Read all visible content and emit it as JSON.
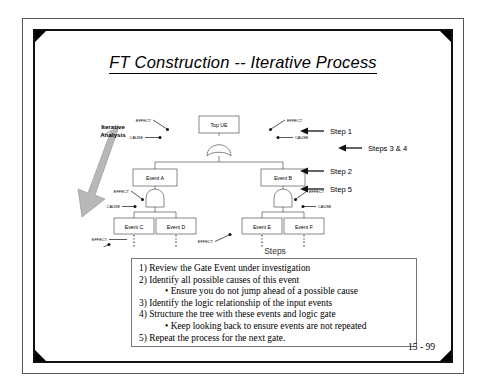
{
  "slide": {
    "title": "FT Construction -- Iterative Process",
    "page_number": "15 - 99"
  },
  "diagram": {
    "iterative_label_line1": "Iterative",
    "iterative_label_line2": "Analysis",
    "nodes": {
      "top": "Top UE",
      "a": "Event A",
      "b": "Event B",
      "c": "Event C",
      "d": "Event D",
      "e": "Event E",
      "f": "Event F"
    },
    "annotations": {
      "effect": "EFFECT",
      "cause": "CAUSE"
    },
    "gates": {
      "top_gate_type": "OR",
      "a_gate_type": "AND",
      "b_gate_type": "AND"
    }
  },
  "steps_markers": [
    {
      "label": "Step 1"
    },
    {
      "label": "Steps 3 & 4"
    },
    {
      "label": "Step 2"
    },
    {
      "label": "Step 5"
    }
  ],
  "steps": {
    "caption": "Steps",
    "items": [
      {
        "text": "1) Review the Gate Event under investigation",
        "sub": false
      },
      {
        "text": "2) Identify all possible causes of this event",
        "sub": false
      },
      {
        "text": "• Ensure you do not jump ahead of a possible cause",
        "sub": true
      },
      {
        "text": "3) Identify the logic relationship of the input events",
        "sub": false
      },
      {
        "text": "4) Structure the tree with these events and logic gate",
        "sub": false
      },
      {
        "text": "• Keep looking back to ensure events are not repeated",
        "sub": true
      },
      {
        "text": "5) Repeat the process for the next gate.",
        "sub": false
      }
    ]
  },
  "colors": {
    "frame": "#111111",
    "outer_frame": "#555555",
    "arrow_fill": "#b8b8b8",
    "text": "#000000"
  }
}
